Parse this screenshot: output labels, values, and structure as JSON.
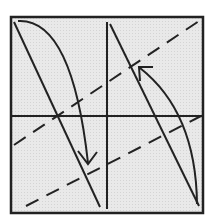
{
  "diagram": {
    "type": "phase-plane",
    "frame": {
      "x": 11,
      "y": 17,
      "width": 192,
      "height": 196,
      "fill": "#e6e6e6",
      "stroke": "#222222"
    },
    "axes": {
      "vertical_x": 107,
      "horizontal_y": 116,
      "stroke": "#222222"
    },
    "solid_lines": [
      {
        "x1": 14,
        "y1": 22,
        "x2": 100,
        "y2": 207
      },
      {
        "x1": 110,
        "y1": 24,
        "x2": 199,
        "y2": 206
      }
    ],
    "dashed_lines": [
      {
        "x1": 14,
        "y1": 145,
        "x2": 202,
        "y2": 19
      },
      {
        "x1": 26,
        "y1": 206,
        "x2": 201,
        "y2": 116
      }
    ],
    "curves": [
      {
        "name": "left-trajectory",
        "path": "M 18 21 Q 72 18 88 163",
        "arrow_at_end": true
      },
      {
        "name": "right-trajectory",
        "path": "M 197 204 Q 196 112 140 68",
        "arrow_at_end": true
      }
    ],
    "colors": {
      "ink": "#222222",
      "background": "#e6e6e6",
      "page": "#ffffff"
    }
  }
}
